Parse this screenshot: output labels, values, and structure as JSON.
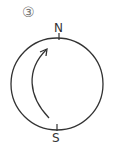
{
  "diagram": {
    "figure_number": "③",
    "north_label": "N",
    "south_label": "S",
    "stroke_color": "#333333",
    "circle": {
      "cx": 57,
      "cy": 84,
      "r": 46
    },
    "arrow": {
      "direction": "counterclockwise from south toward north along inner arc"
    }
  }
}
